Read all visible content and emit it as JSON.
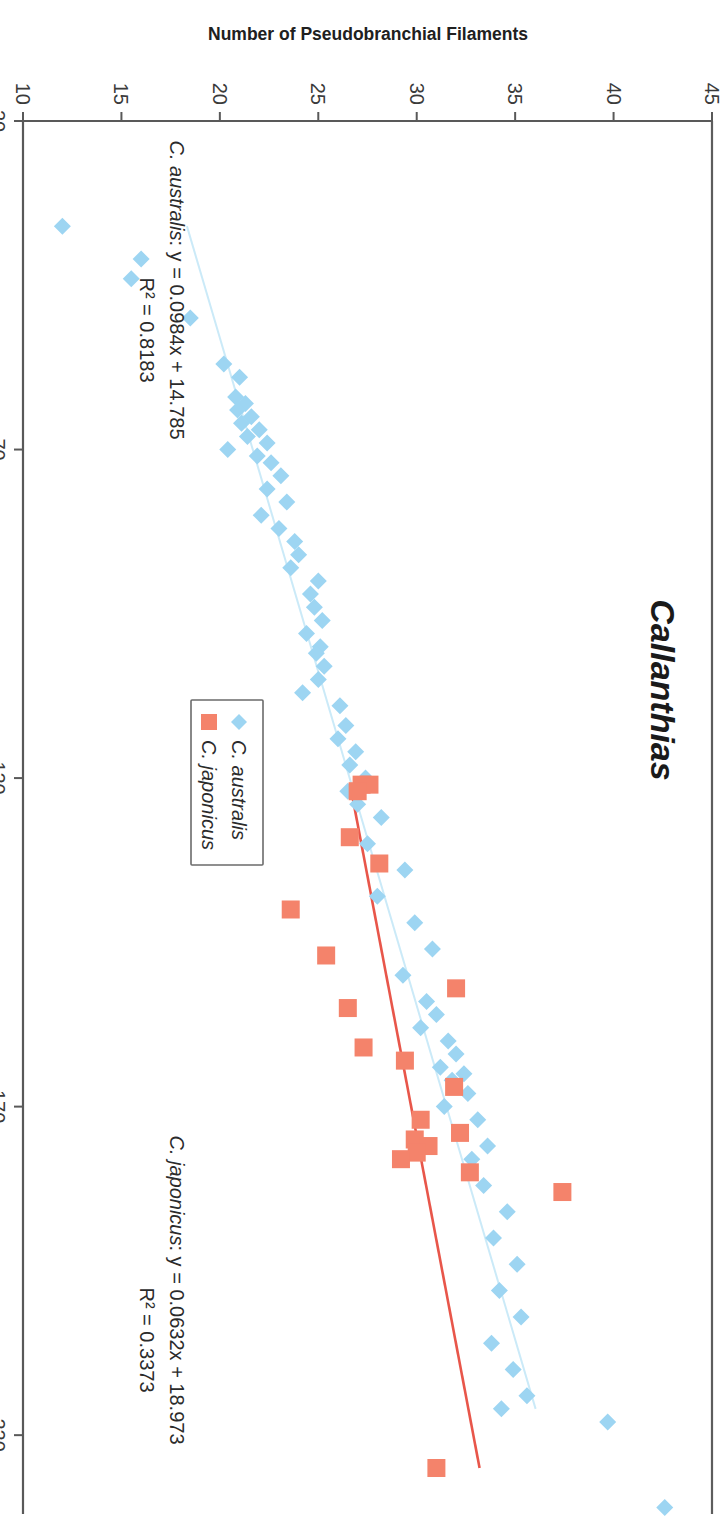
{
  "title": "Callanthias",
  "axes": {
    "x_label": "Standard Length (mm)",
    "y_label": "Number of Pseudobranchial Filaments",
    "x_ticks": [
      "20",
      "70",
      "120",
      "170",
      "220"
    ],
    "y_ticks": [
      "10",
      "15",
      "20",
      "25",
      "30",
      "35",
      "40",
      "45"
    ]
  },
  "legend": {
    "items": [
      {
        "label": "C. australis",
        "marker": "diamond",
        "color": "#9DD5F2"
      },
      {
        "label": "C. japonicus",
        "marker": "square",
        "color": "#F4836B"
      }
    ]
  },
  "annotations": {
    "australis_eq_species": "C. australis",
    "australis_eq_rest": ": y = 0.0984x + 14.785",
    "australis_r2": "R² = 0.8183",
    "japonicus_eq_species": "C. japonicus",
    "japonicus_eq_rest": ": y = 0.0632x + 18.973",
    "japonicus_r2": "R² = 0.3373"
  },
  "colors": {
    "australis": "#9DD5F2",
    "japonicus": "#F4836B",
    "australis_line": "#CBEAF8",
    "japonicus_line": "#E8564A",
    "axis": "#595959"
  },
  "chart_data": {
    "type": "scatter",
    "title": "Callanthias",
    "xlabel": "Standard Length (mm)",
    "ylabel": "Number of Pseudobranchial Filaments",
    "xlim": [
      20,
      232
    ],
    "ylim": [
      10,
      45
    ],
    "grid": false,
    "legend_position": "center-right",
    "series": [
      {
        "name": "C. australis",
        "marker": "diamond",
        "color": "#9DD5F2",
        "fit": {
          "slope": 0.0984,
          "intercept": 14.785,
          "r2": 0.8183,
          "x_start": 36,
          "x_end": 216,
          "color": "#CBEAF8"
        },
        "points": [
          [
            36,
            12
          ],
          [
            41,
            16
          ],
          [
            44,
            15.5
          ],
          [
            50,
            18.5
          ],
          [
            57,
            20.2
          ],
          [
            59,
            21.0
          ],
          [
            62,
            20.8
          ],
          [
            63,
            21.3
          ],
          [
            64,
            20.9
          ],
          [
            65,
            21.6
          ],
          [
            66,
            21.1
          ],
          [
            67,
            22.0
          ],
          [
            68,
            21.4
          ],
          [
            69,
            22.4
          ],
          [
            70,
            20.4
          ],
          [
            71,
            21.9
          ],
          [
            72,
            22.6
          ],
          [
            74,
            23.1
          ],
          [
            76,
            22.4
          ],
          [
            78,
            23.4
          ],
          [
            80,
            22.1
          ],
          [
            82,
            23.0
          ],
          [
            84,
            23.8
          ],
          [
            86,
            24.0
          ],
          [
            88,
            23.6
          ],
          [
            90,
            25.0
          ],
          [
            92,
            24.6
          ],
          [
            94,
            24.8
          ],
          [
            96,
            25.2
          ],
          [
            98,
            24.4
          ],
          [
            100,
            25.1
          ],
          [
            101,
            24.9
          ],
          [
            103,
            25.3
          ],
          [
            105,
            25.0
          ],
          [
            107,
            24.2
          ],
          [
            109,
            26.1
          ],
          [
            112,
            26.4
          ],
          [
            114,
            26.0
          ],
          [
            116,
            26.9
          ],
          [
            118,
            26.6
          ],
          [
            120,
            27.4
          ],
          [
            122,
            26.5
          ],
          [
            124,
            27.0
          ],
          [
            126,
            28.2
          ],
          [
            130,
            27.5
          ],
          [
            134,
            29.4
          ],
          [
            138,
            28.0
          ],
          [
            142,
            29.9
          ],
          [
            146,
            30.8
          ],
          [
            150,
            29.3
          ],
          [
            154,
            30.5
          ],
          [
            156,
            31.0
          ],
          [
            158,
            30.2
          ],
          [
            160,
            31.6
          ],
          [
            162,
            32.0
          ],
          [
            164,
            31.2
          ],
          [
            165,
            32.4
          ],
          [
            166,
            31.8
          ],
          [
            168,
            32.6
          ],
          [
            170,
            31.4
          ],
          [
            172,
            33.1
          ],
          [
            174,
            32.2
          ],
          [
            176,
            33.6
          ],
          [
            178,
            32.8
          ],
          [
            182,
            33.4
          ],
          [
            186,
            34.6
          ],
          [
            190,
            33.9
          ],
          [
            194,
            35.1
          ],
          [
            198,
            34.2
          ],
          [
            202,
            35.3
          ],
          [
            206,
            33.8
          ],
          [
            210,
            34.9
          ],
          [
            214,
            35.6
          ],
          [
            216,
            34.3
          ],
          [
            218,
            39.7
          ],
          [
            231,
            42.6
          ]
        ]
      },
      {
        "name": "C. japonicus",
        "marker": "square",
        "color": "#F4836B",
        "fit": {
          "slope": 0.0632,
          "intercept": 18.973,
          "r2": 0.3373,
          "x_start": 121,
          "x_end": 225,
          "color": "#E8564A"
        },
        "points": [
          [
            121,
            27.2
          ],
          [
            121,
            27.6
          ],
          [
            122,
            27.0
          ],
          [
            129,
            26.6
          ],
          [
            133,
            28.1
          ],
          [
            140,
            23.6
          ],
          [
            147,
            25.4
          ],
          [
            152,
            32.0
          ],
          [
            155,
            26.5
          ],
          [
            161,
            27.3
          ],
          [
            163,
            29.4
          ],
          [
            167,
            31.9
          ],
          [
            172,
            30.2
          ],
          [
            174,
            32.2
          ],
          [
            175,
            29.9
          ],
          [
            176,
            30.6
          ],
          [
            177,
            30.0
          ],
          [
            178,
            29.2
          ],
          [
            180,
            32.7
          ],
          [
            183,
            37.4
          ],
          [
            225,
            31.0
          ]
        ]
      }
    ]
  }
}
